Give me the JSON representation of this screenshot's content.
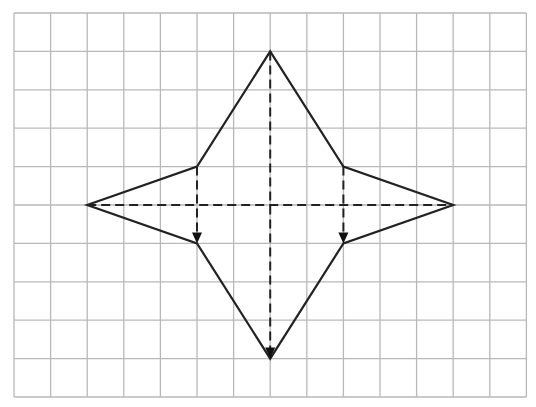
{
  "figure": {
    "grid": {
      "columns": 14,
      "rows": 10,
      "origin_px": [
        14,
        13
      ],
      "cell_w_px": 36.6,
      "cell_h_px": 38.4,
      "line_color": "#b8b8b8"
    },
    "shape": {
      "stroke_color": "#222222",
      "vertices_grid": [
        [
          7,
          1
        ],
        [
          9,
          4
        ],
        [
          12,
          5
        ],
        [
          9,
          6
        ],
        [
          7,
          9
        ],
        [
          5,
          6
        ],
        [
          2,
          5
        ],
        [
          5,
          4
        ]
      ]
    },
    "dashed_lines": [
      {
        "name": "horizontal-axis",
        "from": [
          2,
          5
        ],
        "to": [
          12,
          5
        ],
        "arrow": false
      },
      {
        "name": "vertical-axis",
        "from": [
          7,
          1
        ],
        "to": [
          7,
          9
        ],
        "arrow": true
      },
      {
        "name": "left-fold",
        "from": [
          5,
          4
        ],
        "to": [
          5,
          6
        ],
        "arrow": true
      },
      {
        "name": "right-fold",
        "from": [
          9,
          4
        ],
        "to": [
          9,
          6
        ],
        "arrow": true
      }
    ]
  }
}
